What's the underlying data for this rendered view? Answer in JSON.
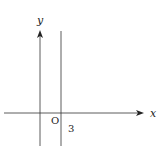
{
  "diagram": {
    "type": "coordinate-plane",
    "colors": {
      "line": "#333333",
      "text": "#222222",
      "background": "#ffffff"
    },
    "labels": {
      "x_axis": "x",
      "y_axis": "y",
      "origin": "O",
      "line_intercept": "3"
    },
    "elements": [
      {
        "kind": "axis",
        "name": "x-axis",
        "direction": "horizontal",
        "arrow": true
      },
      {
        "kind": "axis",
        "name": "y-axis",
        "direction": "vertical",
        "arrow": true
      },
      {
        "kind": "line",
        "name": "vertical-line",
        "equation": "x = 3"
      }
    ]
  }
}
